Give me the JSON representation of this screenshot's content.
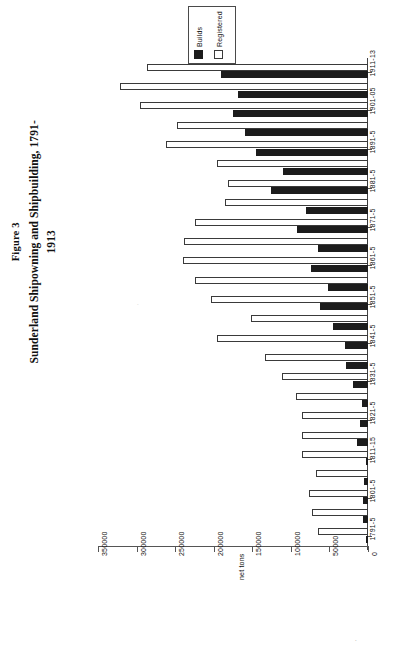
{
  "figure": {
    "number": "Figure 3",
    "title": "Sunderland Shipowning and Shipbuilding, 1791-1913"
  },
  "legend": {
    "position": "top-center",
    "entries": [
      {
        "label": "Builds",
        "color": "#1c1c1c",
        "swatch": "filled-black"
      },
      {
        "label": "Registered",
        "color": "#ffffff",
        "swatch": "open-white"
      }
    ]
  },
  "axis": {
    "value_title": "net tons",
    "value_ticks": [
      "350000",
      "300000",
      "250000",
      "200000",
      "150000",
      "100000",
      "50000",
      "0"
    ],
    "value_min": 0,
    "value_max": 350000,
    "orientation": "horizontal-bar-inverted"
  },
  "marks": {
    "lower_speck": ".",
    "plot_speck": "."
  },
  "chart_data": {
    "type": "bar",
    "orientation": "horizontal",
    "title": "Sunderland Shipowning and Shipbuilding, 1791-1913",
    "subtitle": "Figure 3",
    "xlabel": "net tons",
    "ylabel": "",
    "xlim": [
      0,
      350000
    ],
    "grid": false,
    "legend_position": "top-center",
    "tick_labels_every": 2,
    "categories": [
      "1791-5",
      "1796-1800",
      "1801-5",
      "1806-10",
      "1811-15",
      "1816-20",
      "1821-5",
      "1826-30",
      "1831-5",
      "1836-40",
      "1841-5",
      "1846-50",
      "1851-5",
      "1856-60",
      "1861-5",
      "1866-70",
      "1871-5",
      "1876-80",
      "1881-5",
      "1886-90",
      "1891-5",
      "1896-1900",
      "1901-05",
      "1906-10",
      "1911-13"
    ],
    "labelled_categories": [
      "1791-5",
      "1801-5",
      "1811-15",
      "1821-5",
      "1831-5",
      "1841-5",
      "1851-5",
      "1861-5",
      "1871-5",
      "1881-5",
      "1891-5",
      "1901-05",
      "1911-13"
    ],
    "series": [
      {
        "name": "Builds",
        "color": "#1c1c1c",
        "values": [
          3000,
          6000,
          7000,
          5000,
          3000,
          14000,
          11000,
          8000,
          20000,
          28000,
          30000,
          45000,
          62000,
          52000,
          74000,
          65000,
          92000,
          80000,
          126000,
          110000,
          145000,
          160000,
          175000,
          168000,
          190000
        ]
      },
      {
        "name": "Registered",
        "color": "#ffffff",
        "values": [
          65000,
          72000,
          76000,
          68000,
          85000,
          86000,
          85000,
          94000,
          112000,
          134000,
          196000,
          152000,
          204000,
          224000,
          240000,
          238000,
          224000,
          186000,
          182000,
          196000,
          262000,
          248000,
          296000,
          322000,
          286000
        ]
      }
    ]
  }
}
